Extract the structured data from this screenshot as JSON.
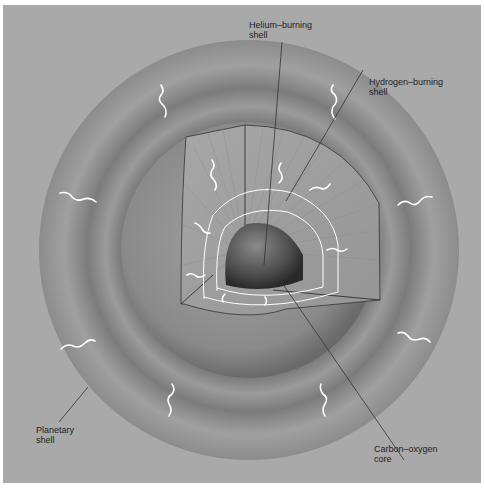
{
  "figure": {
    "labels": {
      "helium": "Helium–burning\nshell",
      "hydrogen": "Hydrogen–burning\nshell",
      "planetary": "Planetary\nshell",
      "core": "Carbon–oxygen\ncore"
    },
    "colors": {
      "background": "#a9a9a9",
      "outer_ring": "#9a9a9a",
      "middle_ring": "#8e8e8e",
      "inner_sphere": "#8a8a8a",
      "core": "#555555",
      "photon": "#ffffff"
    }
  }
}
